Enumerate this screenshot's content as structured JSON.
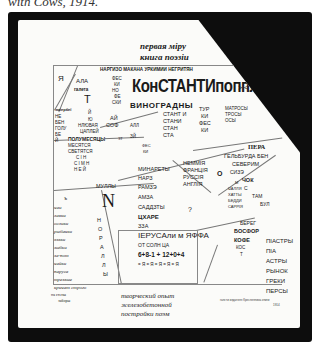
{
  "caption": "with Cows, 1914.",
  "header": {
    "line1": "первая міру",
    "line2": "книга поэзіи"
  },
  "poem": {
    "top_strip": "НАРГИЗО МАКАНА УРКИМИИ НЕГРИТЯН",
    "ya": "Я",
    "ala": "АЛА",
    "galeta": "галета",
    "t_big": "T",
    "fes_stack": [
      "ФЕС",
      "КИ",
      "НО",
      "ФЕ",
      "СКИ"
    ],
    "konstantinopol": "КонСТАНТИпоппль",
    "arrows": "> <",
    "vinogradny": "ВИНОГРАДНЫ",
    "stantin": [
      "СТАНТ И",
      "СТАНИ",
      "СТАН",
      "СТА"
    ],
    "tur": [
      "ТУР",
      "КИ",
      "ФЕС",
      "КИ"
    ],
    "matrosy": [
      "МАТРОСЫ",
      "ТРОСЫ",
      "ОСЫ"
    ],
    "ai_sofi": [
      "АЙ",
      "СОФ"
    ],
    "all": "АЛЛ",
    "zy": "ЗЙ",
    "left_stack": [
      "зміербеї",
      "НЕ",
      "БЕН",
      "ГОЛУ",
      "БЕ",
      "Й"
    ],
    "triangle_stack": [
      "Й",
      "Ю",
      "НЛЮВАЯ",
      "ЦАПЛЕЙ"
    ],
    "polumesyatsy": "ПОЛУМЕСЯЦЫ",
    "zt": "ЗТ",
    "mesyatsy": [
      "МЕСЯТСЯ",
      "СВЕТЯТСЯ",
      "С І Н",
      "С І М Н",
      "Н Е Й"
    ],
    "fes_ki": [
      "ФЕС",
      "КИ"
    ],
    "pera": "ПЕРА",
    "gelburda": "ГЕЛЬБУРДА БЕН",
    "severim": "СЕВЕРИМ",
    "sizz": "СИЗЭ",
    "chok": "ЧОК",
    "s": "С",
    "tam": "ТАМ",
    "bul": "БУЛ",
    "minarety": "МИНАРЕТЫ",
    "nemmia": [
      "НЕММІЯ",
      "ФРАНЦІЯ",
      "РУССІЯ",
      "АНГЛІЯ"
    ],
    "o": "О",
    "mully": "МУЛЛЫ",
    "n_big": "N",
    "narz": "НАРЗ",
    "ramze": "РАМЗЭ",
    "amza": "АМЗА",
    "saadzty": "САДДЗТЫ",
    "tshare": "ЦХАРЕ",
    "zza": "ЗЗА",
    "jerusalem": "ІЕРУСАли м ЯФФА",
    "ot_soln": "ОТ СОЛН ЦА",
    "numbers": "6+8-1 + 12+0+4",
    "pattern": "= Я = Я = Я = Я = Я",
    "question": "?",
    "m_stack": [
      "М",
      "ЧАЛЛЯ",
      "ХАТТЫ",
      "БЕДДИ",
      "САРРІЯ"
    ],
    "b_small": "ъ",
    "left_list": [
      "чаи",
      "лавки",
      "ослики",
      "рыбачки",
      "язвки",
      "зыбки",
      "за-пот",
      "чайки",
      "паруса",
      "трезвые",
      "кричат строго"
    ],
    "noralli": [
      "Н",
      "О",
      "Р",
      "А",
      "Л",
      "Л",
      "Ы"
    ],
    "bereg": "БЕРЕГ",
    "bosfor": "БОСФОР",
    "kofe": "КОФЕ",
    "kos": [
      "КОС",
      "Т"
    ],
    "piastry": [
      "ПІАСТРЫ",
      "ПІА",
      "АСТРЫ",
      "РЫНОК",
      "ГРЕКИ",
      "ПЕРСЫ"
    ]
  },
  "footer": {
    "left": [
      "на стены",
      "заборы"
    ],
    "center": [
      "творческий опыт",
      "железобетонной",
      "постройки поэм"
    ],
    "right": [
      "гансти издателя Кресленника книги",
      "1914"
    ]
  }
}
